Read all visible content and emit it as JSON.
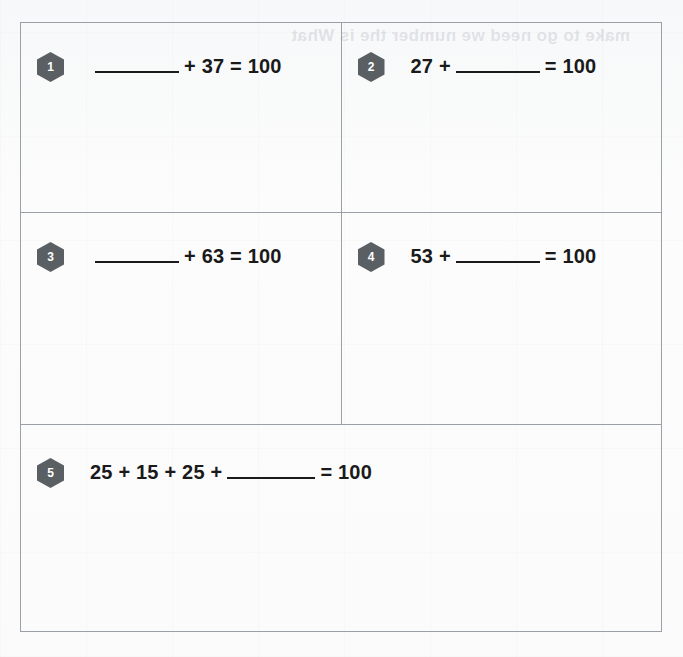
{
  "worksheet": {
    "background_color": "#fbfbfb",
    "border_color": "#9aa0a6",
    "badge_color": "#5a5f63",
    "text_color": "#1a1a1a",
    "ghost_showthrough_text": "make to go need we number the is What"
  },
  "problems": [
    {
      "number": "1",
      "segments": [
        {
          "type": "blank"
        },
        {
          "type": "text",
          "value": "+ 37 = 100"
        }
      ],
      "full_text": "______ + 37 = 100"
    },
    {
      "number": "2",
      "segments": [
        {
          "type": "text",
          "value": "27 +"
        },
        {
          "type": "blank"
        },
        {
          "type": "text",
          "value": "= 100"
        }
      ],
      "full_text": "27 + ______ = 100"
    },
    {
      "number": "3",
      "segments": [
        {
          "type": "blank"
        },
        {
          "type": "text",
          "value": "+ 63 = 100"
        }
      ],
      "full_text": "______ + 63 = 100"
    },
    {
      "number": "4",
      "segments": [
        {
          "type": "text",
          "value": "53 +"
        },
        {
          "type": "blank"
        },
        {
          "type": "text",
          "value": "= 100"
        }
      ],
      "full_text": "53 + ______ = 100"
    },
    {
      "number": "5",
      "segments": [
        {
          "type": "text",
          "value": "25 + 15 + 25 +"
        },
        {
          "type": "blank"
        },
        {
          "type": "text",
          "value": "= 100"
        }
      ],
      "full_text": "25 + 15 + 25 + ______ = 100"
    }
  ]
}
